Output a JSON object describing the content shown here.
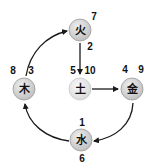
{
  "diagram": {
    "type": "five-elements-river-chart-numbers",
    "colors": {
      "node_fill": "#d4d4d4",
      "node_fill_center": "#e4e4e4",
      "node_stroke": "#9a9a9a",
      "arrow": "#1a1a1a",
      "text": "#111111"
    },
    "nodes": [
      {
        "id": "fire",
        "char": "火",
        "numbers": [
          "7",
          "2"
        ]
      },
      {
        "id": "earth",
        "char": "土",
        "numbers": [
          "5",
          "10"
        ]
      },
      {
        "id": "wood",
        "char": "木",
        "numbers": [
          "8",
          "3"
        ]
      },
      {
        "id": "metal",
        "char": "金",
        "numbers": [
          "4",
          "9"
        ]
      },
      {
        "id": "water",
        "char": "水",
        "numbers": [
          "1",
          "6"
        ]
      }
    ],
    "edges": [
      {
        "from": "fire",
        "to": "earth",
        "style": "straight"
      },
      {
        "from": "earth",
        "to": "metal",
        "style": "straight"
      },
      {
        "from": "metal",
        "to": "water",
        "style": "curved"
      },
      {
        "from": "water",
        "to": "wood",
        "style": "curved"
      },
      {
        "from": "wood",
        "to": "fire",
        "style": "curved"
      }
    ]
  }
}
